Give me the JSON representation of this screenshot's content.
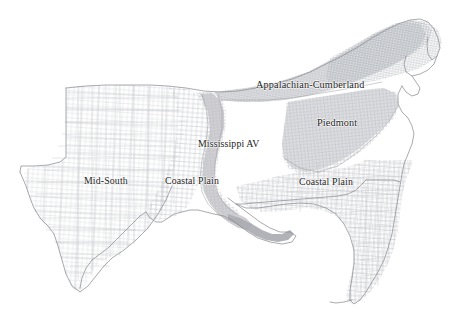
{
  "map": {
    "title": "Southeastern United States county map with agricultural regions",
    "background_color": "#ffffff",
    "outline_color": "#8f9196",
    "county_line_color": "#b9bbc0",
    "label_color": "#1a1a1a",
    "regions": [
      {
        "id": "appalachian-cumberland",
        "label": "Appalachian-Cumberland",
        "shade_color": "#d8d9dc",
        "x": 256,
        "y": 80
      },
      {
        "id": "piedmont",
        "label": "Piedmont",
        "shade_color": "#d2d3d7",
        "x": 317,
        "y": 118
      },
      {
        "id": "mississippi-av",
        "label": "Mississippi AV",
        "shade_color": "#c9cacd",
        "x": 198,
        "y": 139
      },
      {
        "id": "mid-south",
        "label": "Mid-South",
        "shade_color": "#ffffff",
        "x": 84,
        "y": 176
      },
      {
        "id": "coastal-plain-west",
        "label": "Coastal Plain",
        "shade_color": "#ffffff",
        "x": 165,
        "y": 176
      },
      {
        "id": "coastal-plain-east",
        "label": "Coastal Plain",
        "shade_color": "#ffffff",
        "x": 299,
        "y": 177
      }
    ]
  }
}
